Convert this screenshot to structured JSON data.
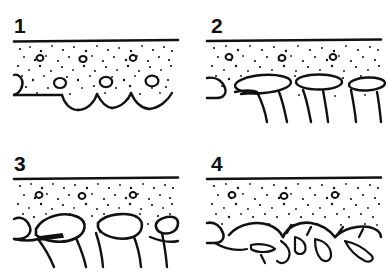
{
  "figure": {
    "background_color": "#ffffff",
    "ink_color": "#111111",
    "width": 389,
    "height": 273,
    "panel_count": 4,
    "layout": "2x2 grid"
  },
  "panels": [
    {
      "number": "1",
      "caption": "Stage 1",
      "description": "Intact cortical surface with dense stippled matrix and small round lacunae; smooth rounded trabecular arches at the lower margin.",
      "stage_index": 1,
      "surface_line": "continuous thick horizontal line",
      "lacuna_count": 7,
      "arch_count": 3,
      "matrix_density": "dense"
    },
    {
      "number": "2",
      "caption": "Stage 2",
      "description": "Enlarged flattened marrow spaces appear beneath the surface; trabecular struts thin and descend as narrow pillars.",
      "stage_index": 2,
      "surface_line": "continuous thick horizontal line",
      "lacuna_count": 5,
      "arch_count": 3,
      "matrix_density": "moderate"
    },
    {
      "number": "3",
      "caption": "Stage 3",
      "description": "Resorption cavities coalesce into large lobate spaces; remaining trabeculae form slender branching struts.",
      "stage_index": 3,
      "surface_line": "continuous thick horizontal line",
      "lacuna_count": 5,
      "arch_count": 3,
      "matrix_density": "reduced"
    },
    {
      "number": "4",
      "caption": "Stage 4",
      "description": "Trabecular network is fragmented into disconnected spicules and isolated remnants beneath an undulating eroded surface.",
      "stage_index": 4,
      "surface_line": "continuous thick horizontal line",
      "lacuna_count": 5,
      "arch_count": 3,
      "matrix_density": "sparse, fragmented"
    }
  ]
}
